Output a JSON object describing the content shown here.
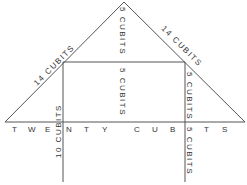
{
  "diagram": {
    "colors": {
      "line": "#555555",
      "text": "#333333",
      "background": "#ffffff"
    },
    "labels": {
      "left_slope": "14 CUBITS",
      "right_slope": "14 CUBITS",
      "apex_height": "5 CUBITS",
      "room_height_center": "5 CUBITS",
      "room_height_right": "5 CUBITS",
      "left_post": "10 CUBITS",
      "right_lower": "5 CUBITS",
      "base": [
        "T",
        "W",
        "E",
        "N",
        "T",
        "Y",
        "C",
        "U",
        "B",
        "I",
        "T",
        "S"
      ]
    }
  }
}
